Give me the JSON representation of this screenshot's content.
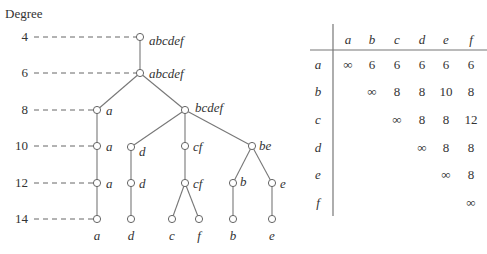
{
  "tree": {
    "axis_title": "Degree",
    "degrees": [
      {
        "label": "4",
        "y": 37,
        "x_end": 136
      },
      {
        "label": "6",
        "y": 73,
        "x_end": 136
      },
      {
        "label": "8",
        "y": 110,
        "x_end": 93
      },
      {
        "label": "10",
        "y": 146,
        "x_end": 93
      },
      {
        "label": "12",
        "y": 183,
        "x_end": 93
      },
      {
        "label": "14",
        "y": 219,
        "x_end": 93
      }
    ],
    "nodes": [
      {
        "id": "n0",
        "label": "abcdef",
        "x": 140,
        "y": 37,
        "lx": 149,
        "ly": 41,
        "anchor": "start"
      },
      {
        "id": "n1",
        "label": "abcdef",
        "x": 140,
        "y": 73,
        "lx": 149,
        "ly": 74,
        "anchor": "start"
      },
      {
        "id": "n2",
        "label": "a",
        "x": 97,
        "y": 110,
        "lx": 106,
        "ly": 111,
        "anchor": "start"
      },
      {
        "id": "n3",
        "label": "bcdef",
        "x": 185,
        "y": 110,
        "lx": 195,
        "ly": 108,
        "anchor": "start"
      },
      {
        "id": "n4",
        "label": "a",
        "x": 97,
        "y": 146,
        "lx": 106,
        "ly": 147,
        "anchor": "start"
      },
      {
        "id": "n5",
        "label": "d",
        "x": 131,
        "y": 147,
        "lx": 139,
        "ly": 152,
        "anchor": "start"
      },
      {
        "id": "n6",
        "label": "cf",
        "x": 185,
        "y": 146,
        "lx": 193,
        "ly": 147,
        "anchor": "start"
      },
      {
        "id": "n7",
        "label": "be",
        "x": 252,
        "y": 146,
        "lx": 259,
        "ly": 146,
        "anchor": "start"
      },
      {
        "id": "n8",
        "label": "a",
        "x": 97,
        "y": 183,
        "lx": 106,
        "ly": 184,
        "anchor": "start"
      },
      {
        "id": "n9",
        "label": "d",
        "x": 131,
        "y": 183,
        "lx": 139,
        "ly": 184,
        "anchor": "start"
      },
      {
        "id": "n10",
        "label": "cf",
        "x": 185,
        "y": 183,
        "lx": 193,
        "ly": 184,
        "anchor": "start"
      },
      {
        "id": "n11",
        "label": "b",
        "x": 233,
        "y": 183,
        "lx": 240,
        "ly": 182,
        "anchor": "start"
      },
      {
        "id": "n12",
        "label": "e",
        "x": 272,
        "y": 183,
        "lx": 280,
        "ly": 184,
        "anchor": "start"
      },
      {
        "id": "n13",
        "label": "a",
        "x": 97,
        "y": 219,
        "lx": 97,
        "ly": 236,
        "anchor": "middle"
      },
      {
        "id": "n14",
        "label": "d",
        "x": 131,
        "y": 219,
        "lx": 131,
        "ly": 236,
        "anchor": "middle"
      },
      {
        "id": "n15",
        "label": "c",
        "x": 172,
        "y": 219,
        "lx": 172,
        "ly": 236,
        "anchor": "middle"
      },
      {
        "id": "n16",
        "label": "f",
        "x": 199,
        "y": 219,
        "lx": 199,
        "ly": 236,
        "anchor": "middle"
      },
      {
        "id": "n17",
        "label": "b",
        "x": 233,
        "y": 219,
        "lx": 233,
        "ly": 236,
        "anchor": "middle"
      },
      {
        "id": "n18",
        "label": "e",
        "x": 272,
        "y": 219,
        "lx": 272,
        "ly": 236,
        "anchor": "middle"
      }
    ],
    "edges": [
      [
        "n0",
        "n1"
      ],
      [
        "n1",
        "n2"
      ],
      [
        "n1",
        "n3"
      ],
      [
        "n2",
        "n4"
      ],
      [
        "n3",
        "n5"
      ],
      [
        "n3",
        "n6"
      ],
      [
        "n3",
        "n7"
      ],
      [
        "n4",
        "n8"
      ],
      [
        "n5",
        "n9"
      ],
      [
        "n6",
        "n10"
      ],
      [
        "n7",
        "n11"
      ],
      [
        "n7",
        "n12"
      ],
      [
        "n8",
        "n13"
      ],
      [
        "n9",
        "n14"
      ],
      [
        "n10",
        "n15"
      ],
      [
        "n10",
        "n16"
      ],
      [
        "n11",
        "n17"
      ],
      [
        "n12",
        "n18"
      ]
    ]
  },
  "matrix": {
    "headers": [
      "a",
      "b",
      "c",
      "d",
      "e",
      "f"
    ],
    "col_x": [
      348,
      372,
      397,
      422,
      446,
      471
    ],
    "header_y": 44,
    "rows": [
      {
        "label": "a",
        "y": 69,
        "cells": [
          "∞",
          "6",
          "6",
          "6",
          "6",
          "6"
        ]
      },
      {
        "label": "b",
        "y": 96,
        "cells": [
          "",
          "∞",
          "8",
          "8",
          "10",
          "8"
        ]
      },
      {
        "label": "c",
        "y": 124,
        "cells": [
          "",
          "",
          "∞",
          "8",
          "8",
          "12"
        ]
      },
      {
        "label": "d",
        "y": 152,
        "cells": [
          "",
          "",
          "",
          "∞",
          "8",
          "8"
        ]
      },
      {
        "label": "e",
        "y": 179,
        "cells": [
          "",
          "",
          "",
          "",
          "∞",
          "8"
        ]
      },
      {
        "label": "f",
        "y": 207,
        "cells": [
          "",
          "",
          "",
          "",
          "",
          "∞"
        ]
      }
    ]
  }
}
